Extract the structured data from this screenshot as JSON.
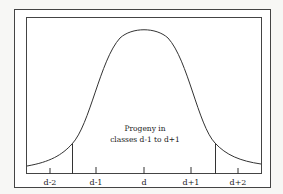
{
  "diagram": {
    "type": "normal-distribution",
    "annotation_line1": "Progeny in",
    "annotation_line2": "classes d-1 to d+1",
    "axis_labels": [
      "d-2",
      "d-1",
      "d",
      "d+1",
      "d+2"
    ],
    "colors": {
      "line": "#333333",
      "background": "#ffffff"
    }
  }
}
